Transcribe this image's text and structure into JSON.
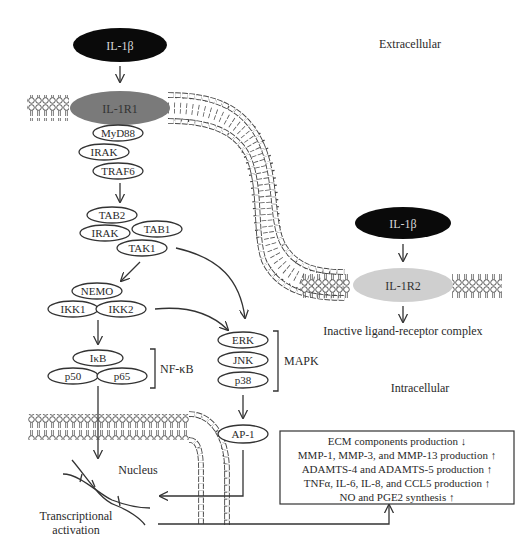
{
  "regions": {
    "extracellular": "Extracellular",
    "intracellular": "Intracellular",
    "nucleus": "Nucleus"
  },
  "ligand_left": {
    "label": "IL-1β",
    "color": "#0a0a0a"
  },
  "receptor_left": {
    "label": "IL-1R1",
    "color": "#7a7a7a"
  },
  "adaptors": [
    "MyD88",
    "IRAK",
    "TRAF6"
  ],
  "tak_complex": [
    "TAB2",
    "IRAK",
    "TAB1",
    "TAK1"
  ],
  "ikk_complex": [
    "NEMO",
    "IKK1",
    "IKK2"
  ],
  "nfkb": {
    "members": [
      "IκB",
      "p50",
      "p65"
    ],
    "label": "NF-κB"
  },
  "mapk": {
    "members": [
      "ERK",
      "JNK",
      "p38"
    ],
    "label": "MAPK"
  },
  "ap1": "AP-1",
  "ligand_right": {
    "label": "IL-1β",
    "color": "#0a0a0a"
  },
  "receptor_right": {
    "label": "IL-1R2",
    "color": "#cfcfcf"
  },
  "inactive_label": "Inactive ligand-receptor complex",
  "transcription_label": [
    "Transcriptional",
    "activation"
  ],
  "outcomes": [
    "ECM components production ↓",
    "MMP-1, MMP-3, and MMP-13 production ↑",
    "ADAMTS-4 and ADAMTS-5 production ↑",
    "TNFα, IL-6, IL-8, and CCL5 production ↑",
    "NO and PGE2 synthesis ↑"
  ]
}
